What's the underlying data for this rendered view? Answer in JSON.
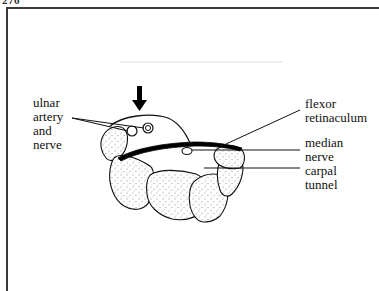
{
  "page": {
    "number": "276"
  },
  "figure": {
    "arrow": {
      "direction": "down",
      "color": "#000000"
    },
    "labels": {
      "ulnar": "ulnar\nartery\nand\nnerve",
      "flexor": "flexor\nretinaculum",
      "median": "median\nnerve",
      "carpal": "carpal\ntunnel"
    },
    "colors": {
      "line": "#111111",
      "bone_fill": "#f4f4f4",
      "stipple": "#777777",
      "frame": "#3a3a3a"
    }
  }
}
